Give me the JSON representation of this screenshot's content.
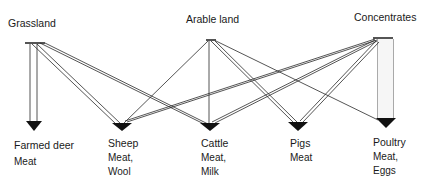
{
  "sources": [
    {
      "id": "grassland",
      "label": "Grassland"
    },
    {
      "id": "arable",
      "label": "Arable land"
    },
    {
      "id": "concentrates",
      "label": "Concentrates"
    }
  ],
  "animals": [
    {
      "id": "deer",
      "label": "Farmed deer",
      "products": "Meat"
    },
    {
      "id": "sheep",
      "label": "Sheep",
      "products": "Meat,\nWool"
    },
    {
      "id": "cattle",
      "label": "Cattle",
      "products": "Meat,\nMilk"
    },
    {
      "id": "pigs",
      "label": "Pigs",
      "products": "Meat"
    },
    {
      "id": "poultry",
      "label": "Poultry",
      "products": "Meat,\nEggs"
    }
  ],
  "flows": [
    {
      "from": "Grassland",
      "to": "Farmed deer"
    },
    {
      "from": "Grassland",
      "to": "Sheep"
    },
    {
      "from": "Grassland",
      "to": "Cattle"
    },
    {
      "from": "Arable land",
      "to": "Sheep"
    },
    {
      "from": "Arable land",
      "to": "Cattle"
    },
    {
      "from": "Arable land",
      "to": "Pigs"
    },
    {
      "from": "Arable land",
      "to": "Poultry"
    },
    {
      "from": "Concentrates",
      "to": "Sheep"
    },
    {
      "from": "Concentrates",
      "to": "Cattle"
    },
    {
      "from": "Concentrates",
      "to": "Pigs"
    },
    {
      "from": "Concentrates",
      "to": "Poultry"
    }
  ]
}
